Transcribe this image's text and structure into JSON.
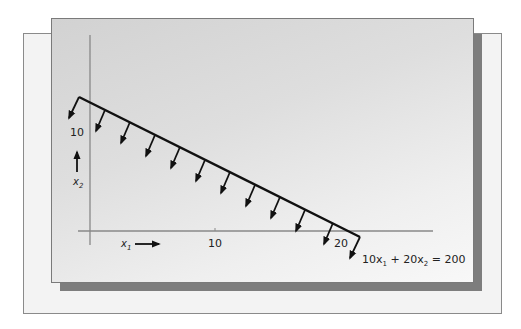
{
  "diagram": {
    "type": "linear-constraint-plot",
    "axes": {
      "x_label": "x",
      "x_label_sub": "1",
      "y_label": "x",
      "y_label_sub": "2",
      "x_ticks": [
        "10",
        "20"
      ],
      "y_ticks": [
        "10"
      ]
    },
    "constraint": {
      "equation_parts": {
        "c1": "10x",
        "s1": "1",
        "mid": " + 20x",
        "s2": "2",
        "rhs": " = 200"
      },
      "x_intercept": 20,
      "y_intercept": 10,
      "hatch_direction": "below-left (feasible side)"
    },
    "colors": {
      "line": "#111111",
      "axis": "#888888",
      "panel": "#dcdcdc",
      "shadow": "#7d7d7d"
    }
  }
}
